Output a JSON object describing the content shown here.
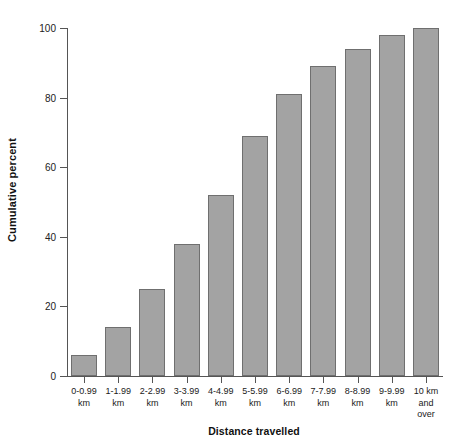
{
  "chart_data": {
    "type": "bar",
    "title": "",
    "xlabel": "Distance travelled",
    "ylabel": "Cumulative percent",
    "categories": [
      "0-0.99 km",
      "1-1.99 km",
      "2-2.99 km",
      "3-3.99 km",
      "4-4.99 km",
      "5-5.99 km",
      "6-6.99 km",
      "7-7.99 km",
      "8-8.99 km",
      "9-9.99 km",
      "10 km and over"
    ],
    "category_lines": [
      [
        "0-0.99",
        "km"
      ],
      [
        "1-1.99",
        "km"
      ],
      [
        "2-2.99",
        "km"
      ],
      [
        "3-3.99",
        "km"
      ],
      [
        "4-4.99",
        "km"
      ],
      [
        "5-5.99",
        "km"
      ],
      [
        "6-6.99",
        "km"
      ],
      [
        "7-7.99",
        "km"
      ],
      [
        "8-8.99",
        "km"
      ],
      [
        "9-9.99",
        "km"
      ],
      [
        "10 km",
        "and",
        "over"
      ]
    ],
    "values": [
      6,
      14,
      25,
      38,
      52,
      69,
      81,
      89,
      94,
      98,
      100
    ],
    "ylim": [
      0,
      100
    ],
    "yticks": [
      0,
      20,
      40,
      60,
      80,
      100
    ],
    "ytick_labels": [
      "0",
      "20",
      "40",
      "60",
      "80",
      "100"
    ],
    "grid": false,
    "legend": "none",
    "bar_fill": "#a3a3a3",
    "bar_edge": "#6f6f6f",
    "axis_color": "#555555",
    "background": "#ffffff"
  }
}
